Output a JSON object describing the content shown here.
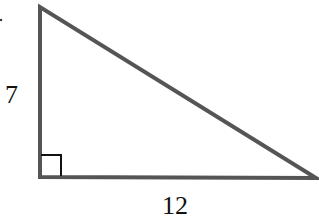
{
  "figure": {
    "type": "right-triangle",
    "stroke_color": "#555555",
    "right_angle_marker_color": "#111111",
    "vertices": {
      "top": [
        40,
        7
      ],
      "right_angle": [
        40,
        176
      ],
      "right": [
        316,
        178
      ]
    },
    "labels": {
      "vertical_leg": "7",
      "horizontal_leg": "12"
    },
    "right_angle_marker": true
  }
}
